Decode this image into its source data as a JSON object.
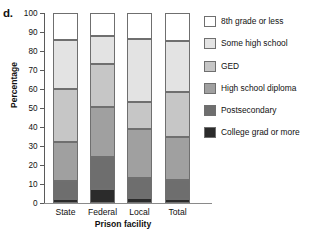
{
  "panel_letter": "d.",
  "top_caption_fragment": "",
  "axes": {
    "ylabel": "Percentage",
    "xlabel": "Prison facility",
    "ylim": [
      0,
      100
    ],
    "yticks": [
      0,
      10,
      20,
      30,
      40,
      50,
      60,
      70,
      80,
      90,
      100
    ],
    "ytick_labels": [
      "0",
      "10",
      "20",
      "30",
      "40",
      "50",
      "60",
      "70",
      "80",
      "90",
      "100"
    ],
    "grid": false
  },
  "legend": {
    "position": "right",
    "entries": [
      {
        "label": "8th grade or less",
        "color": "#ffffff",
        "swatch_name": "legend-swatch-8th-grade-or-less"
      },
      {
        "label": "Some high school",
        "color": "#e3e3e3",
        "swatch_name": "legend-swatch-some-high-school"
      },
      {
        "label": "GED",
        "color": "#c6c6c6",
        "swatch_name": "legend-swatch-ged"
      },
      {
        "label": "High school diploma",
        "color": "#a0a0a0",
        "swatch_name": "legend-swatch-high-school-diploma"
      },
      {
        "label": "Postsecondary",
        "color": "#6e6e6e",
        "swatch_name": "legend-swatch-postsecondary"
      },
      {
        "label": "College grad or more",
        "color": "#2b2b2b",
        "swatch_name": "legend-swatch-college-grad-or-more"
      }
    ]
  },
  "chart_data": {
    "type": "bar",
    "subtype": "stacked-100-percent",
    "title": "",
    "xlabel": "Prison facility",
    "ylabel": "Percentage",
    "ylim": [
      0,
      100
    ],
    "yticks": [
      0,
      10,
      20,
      30,
      40,
      50,
      60,
      70,
      80,
      90,
      100
    ],
    "grid": false,
    "legend_position": "right",
    "categories": [
      "State",
      "Federal",
      "Local",
      "Total"
    ],
    "series": [
      {
        "name": "College grad or more",
        "color": "#2b2b2b",
        "values": [
          2.0,
          7.5,
          2.5,
          2.0
        ]
      },
      {
        "name": "Postsecondary",
        "color": "#6e6e6e",
        "values": [
          9.5,
          16.5,
          10.5,
          10.0
        ]
      },
      {
        "name": "High school diploma",
        "color": "#a0a0a0",
        "values": [
          20.5,
          26.5,
          26.0,
          22.5
        ]
      },
      {
        "name": "GED",
        "color": "#c6c6c6",
        "values": [
          28.0,
          22.5,
          14.0,
          24.0
        ]
      },
      {
        "name": "Some high school",
        "color": "#e3e3e3",
        "values": [
          26.0,
          15.0,
          33.5,
          27.0
        ]
      },
      {
        "name": "8th grade or less",
        "color": "#ffffff",
        "values": [
          14.0,
          12.0,
          13.5,
          14.5
        ]
      }
    ],
    "cumulative_boundaries": {
      "State": [
        0,
        2.0,
        11.5,
        32.0,
        60.0,
        86.0,
        100
      ],
      "Federal": [
        0,
        7.5,
        24.0,
        50.5,
        73.0,
        88.0,
        100
      ],
      "Local": [
        0,
        2.5,
        13.0,
        39.0,
        53.0,
        86.5,
        100
      ],
      "Total": [
        0,
        2.0,
        12.0,
        34.5,
        58.5,
        85.5,
        100
      ]
    }
  }
}
